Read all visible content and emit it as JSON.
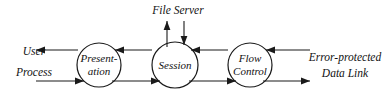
{
  "diagram": {
    "background_color": "#ffffff",
    "stroke_color": "#1a1a1a",
    "text_color": "#121212",
    "nodes": [
      {
        "id": "presentation",
        "label_line1": "Present-",
        "label_line2": "ation",
        "cx": 99,
        "cy": 65,
        "r": 22
      },
      {
        "id": "session",
        "label_line1": "Session",
        "label_line2": "",
        "cx": 175,
        "cy": 65,
        "r": 23
      },
      {
        "id": "flow-control",
        "label_line1": "Flow",
        "label_line2": "Control",
        "cx": 250,
        "cy": 65,
        "r": 22
      }
    ],
    "side_labels": {
      "left": {
        "line1": "User",
        "line2": "Process"
      },
      "right": {
        "line1": "Error-protected",
        "line2": "Data Link"
      }
    },
    "top_label": {
      "text": "File Server"
    },
    "edges": [
      {
        "id": "presentation-to-user",
        "direction": "left",
        "row": "top"
      },
      {
        "id": "user-to-presentation",
        "direction": "right",
        "row": "bottom"
      },
      {
        "id": "session-to-presentation",
        "direction": "left",
        "row": "top"
      },
      {
        "id": "presentation-to-session",
        "direction": "right",
        "row": "bottom"
      },
      {
        "id": "flowcontrol-to-session",
        "direction": "left",
        "row": "top"
      },
      {
        "id": "session-to-flowcontrol",
        "direction": "right",
        "row": "bottom"
      },
      {
        "id": "datalink-to-flowcontrol",
        "direction": "left",
        "row": "top"
      },
      {
        "id": "flowcontrol-to-datalink",
        "direction": "right",
        "row": "bottom"
      },
      {
        "id": "session-to-fileserver",
        "direction": "up",
        "row": "vertical"
      },
      {
        "id": "fileserver-to-session",
        "direction": "down",
        "row": "vertical"
      }
    ]
  }
}
